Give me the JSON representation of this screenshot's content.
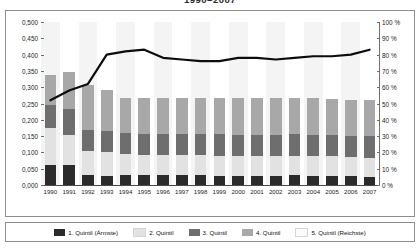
{
  "title": "1990–2007",
  "legend": {
    "items": [
      {
        "label": "1. Quintil (Ärmste)",
        "color": "#2b2b2b"
      },
      {
        "label": "2. Quintil",
        "color": "#e2e2e2"
      },
      {
        "label": "3. Quintil",
        "color": "#6e6e6e"
      },
      {
        "label": "4. Quintil",
        "color": "#a8a8a8"
      },
      {
        "label": "5. Quintil (Reichste)",
        "color": "#fbfbfb"
      }
    ]
  },
  "chart_data": {
    "type": "bar",
    "title": "1990–2007",
    "xlabel": "",
    "ylabel": "",
    "grid": false,
    "legend_position": "bottom",
    "categories": [
      "1990",
      "1991",
      "1992",
      "1993",
      "1994",
      "1995",
      "1996",
      "1997",
      "1998",
      "1999",
      "2000",
      "2001",
      "2002",
      "2003",
      "2004",
      "2005",
      "2006",
      "2007"
    ],
    "y_left": {
      "label": "",
      "ticks": [
        "0,000",
        "0,050",
        "0,100",
        "0,150",
        "0,200",
        "0,250",
        "0,300",
        "0,350",
        "0,400",
        "0,450",
        "0,500"
      ],
      "values": [
        0.0,
        0.05,
        0.1,
        0.15,
        0.2,
        0.25,
        0.3,
        0.35,
        0.4,
        0.45,
        0.5
      ],
      "ylim": [
        0.0,
        0.5
      ]
    },
    "y_right": {
      "label": "",
      "ticks": [
        "0 %",
        "10 %",
        "20 %",
        "30 %",
        "40 %",
        "50 %",
        "60 %",
        "70 %",
        "80 %",
        "90 %",
        "100 %"
      ],
      "values": [
        0,
        10,
        20,
        30,
        40,
        50,
        60,
        70,
        80,
        90,
        100
      ],
      "ylim": [
        0,
        100
      ]
    },
    "series": [
      {
        "name": "1. Quintil (Ärmste)",
        "type": "bar-segment",
        "color": "#2b2b2b",
        "values": [
          0.062,
          0.062,
          0.03,
          0.028,
          0.03,
          0.03,
          0.03,
          0.03,
          0.03,
          0.028,
          0.028,
          0.028,
          0.028,
          0.03,
          0.028,
          0.028,
          0.028,
          0.026
        ]
      },
      {
        "name": "2. Quintil",
        "type": "bar-segment",
        "color": "#e2e2e2",
        "values": [
          0.113,
          0.09,
          0.075,
          0.072,
          0.065,
          0.062,
          0.062,
          0.062,
          0.062,
          0.062,
          0.06,
          0.06,
          0.06,
          0.06,
          0.06,
          0.06,
          0.058,
          0.058
        ]
      },
      {
        "name": "3. Quintil",
        "type": "bar-segment",
        "color": "#6e6e6e",
        "values": [
          0.07,
          0.08,
          0.065,
          0.065,
          0.065,
          0.065,
          0.065,
          0.065,
          0.065,
          0.065,
          0.065,
          0.065,
          0.065,
          0.065,
          0.065,
          0.065,
          0.065,
          0.065
        ]
      },
      {
        "name": "4. Quintil",
        "type": "bar-segment",
        "color": "#a8a8a8",
        "values": [
          0.092,
          0.115,
          0.138,
          0.127,
          0.108,
          0.111,
          0.111,
          0.111,
          0.111,
          0.113,
          0.113,
          0.113,
          0.113,
          0.113,
          0.113,
          0.111,
          0.111,
          0.111
        ]
      },
      {
        "name": "5. Quintil (Reichste)",
        "type": "bar-segment",
        "color": "#fbfbfb",
        "values": [
          0.0,
          0.0,
          0.0,
          0.0,
          0.0,
          0.0,
          0.0,
          0.0,
          0.0,
          0.0,
          0.0,
          0.0,
          0.0,
          0.0,
          0.0,
          0.0,
          0.0,
          0.0
        ]
      },
      {
        "name": "Linie (rechte Achse)",
        "type": "line",
        "color": "#0d0d0d",
        "axis": "right",
        "values": [
          52,
          58,
          62,
          80,
          82,
          83,
          78,
          77,
          76,
          76,
          78,
          78,
          77,
          78,
          79,
          79,
          80,
          83
        ]
      }
    ],
    "bar_totals": [
      0.337,
      0.347,
      0.308,
      0.292,
      0.268,
      0.268,
      0.268,
      0.268,
      0.268,
      0.268,
      0.266,
      0.266,
      0.266,
      0.268,
      0.266,
      0.264,
      0.262,
      0.26
    ]
  }
}
